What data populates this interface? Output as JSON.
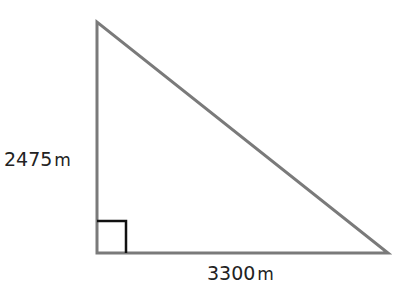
{
  "diagram": {
    "type": "right-triangle",
    "vertical_leg": {
      "value": "2475",
      "unit": "m"
    },
    "horizontal_leg": {
      "value": "3300",
      "unit": "m"
    },
    "right_angle_marker": true,
    "colors": {
      "triangle_stroke": "#7a7a7a",
      "right_angle_stroke": "#111111",
      "label_text": "#222222",
      "background": "#ffffff"
    }
  }
}
